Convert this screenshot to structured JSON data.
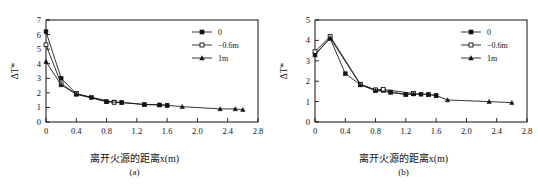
{
  "figure": {
    "panels": [
      {
        "caption": "(a)",
        "xlabel": "离开火源的距离x(m)",
        "ylabel": "ΔT*",
        "legend": [
          {
            "label": "0",
            "marker": "filled-square"
          },
          {
            "label": "−0.6m",
            "marker": "open-square"
          },
          {
            "label": "1m",
            "marker": "filled-triangle"
          }
        ]
      },
      {
        "caption": "(b)",
        "xlabel": "离开火源的距离x(m)",
        "ylabel": "ΔT*",
        "legend": [
          {
            "label": "0",
            "marker": "filled-square"
          },
          {
            "label": "−0.6m",
            "marker": "open-square"
          },
          {
            "label": "1m",
            "marker": "filled-triangle"
          }
        ]
      }
    ]
  },
  "chart_data": [
    {
      "type": "line",
      "panel": "(a)",
      "title": "",
      "xlabel": "离开火源的距离x(m)",
      "ylabel": "ΔT*",
      "xlim": [
        0,
        2.8
      ],
      "ylim": [
        0,
        7
      ],
      "xticks": [
        "0",
        "0.4",
        "0.8",
        "1.2",
        "1.6",
        "2.0",
        "2.4",
        "2.8"
      ],
      "xtickvals": [
        0,
        0.4,
        0.8,
        1.2,
        1.6,
        2.0,
        2.4,
        2.8
      ],
      "yticks": [
        "0",
        "1",
        "2",
        "3",
        "4",
        "5",
        "6",
        "7"
      ],
      "ytickvals": [
        0,
        1,
        2,
        3,
        4,
        5,
        6,
        7
      ],
      "grid": false,
      "legend_position": "top-right",
      "series": [
        {
          "name": "0",
          "marker": "filled-square",
          "x": [
            0,
            0.2,
            0.4,
            0.6,
            0.8,
            0.9,
            1.0,
            1.3,
            1.5,
            1.6
          ],
          "y": [
            6.2,
            3.0,
            1.95,
            1.68,
            1.4,
            1.37,
            1.35,
            1.2,
            1.17,
            1.15
          ]
        },
        {
          "name": "−0.6m",
          "marker": "open-square",
          "x": [
            0,
            0.2,
            0.4,
            0.9
          ],
          "y": [
            5.3,
            2.62,
            1.93,
            1.35
          ]
        },
        {
          "name": "1m",
          "marker": "filled-triangle",
          "x": [
            0,
            0.2,
            0.4,
            0.8,
            1.0,
            1.3,
            1.5,
            1.6,
            1.8,
            2.3,
            2.5,
            2.6
          ],
          "y": [
            4.15,
            2.55,
            1.9,
            1.4,
            1.33,
            1.2,
            1.18,
            1.15,
            1.05,
            0.9,
            0.9,
            0.85
          ]
        }
      ]
    },
    {
      "type": "line",
      "panel": "(b)",
      "title": "",
      "xlabel": "离开火源的距离x(m)",
      "ylabel": "ΔT*",
      "xlim": [
        0,
        2.8
      ],
      "ylim": [
        0,
        5
      ],
      "xticks": [
        "0",
        "0.4",
        "0.8",
        "1.2",
        "1.6",
        "2.0",
        "2.4",
        "2.8"
      ],
      "xtickvals": [
        0,
        0.4,
        0.8,
        1.2,
        1.6,
        2.0,
        2.4,
        2.8
      ],
      "yticks": [
        "0",
        "1",
        "2",
        "3",
        "4",
        "5"
      ],
      "ytickvals": [
        0,
        1,
        2,
        3,
        4,
        5
      ],
      "grid": false,
      "legend_position": "top-right",
      "series": [
        {
          "name": "0",
          "marker": "filled-square",
          "x": [
            0,
            0.2,
            0.4,
            0.6,
            0.8,
            0.9,
            1.0,
            1.2,
            1.3,
            1.4,
            1.5,
            1.6
          ],
          "y": [
            3.33,
            4.1,
            2.37,
            1.83,
            1.55,
            1.55,
            1.47,
            1.35,
            1.38,
            1.36,
            1.35,
            1.3
          ]
        },
        {
          "name": "−0.6m",
          "marker": "open-square",
          "x": [
            0,
            0.2,
            0.6,
            0.8,
            0.9,
            1.3
          ],
          "y": [
            3.45,
            4.2,
            1.85,
            1.58,
            1.6,
            1.4
          ]
        },
        {
          "name": "1m",
          "marker": "filled-triangle",
          "x": [
            0,
            0.2,
            0.6,
            0.8,
            1.0,
            1.2,
            1.3,
            1.5,
            1.6,
            1.75,
            2.3,
            2.6
          ],
          "y": [
            3.28,
            4.12,
            1.82,
            1.55,
            1.45,
            1.35,
            1.38,
            1.35,
            1.3,
            1.08,
            1.0,
            0.95
          ]
        }
      ]
    }
  ]
}
